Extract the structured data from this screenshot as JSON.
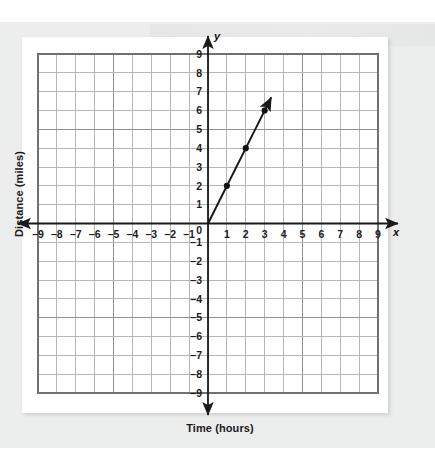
{
  "figure": {
    "x_axis_title": "Time (hours)",
    "y_axis_title": "Distance (miles)",
    "x_axis_letter": "x",
    "y_axis_letter": "y",
    "origin_label": "0"
  },
  "colors": {
    "page_background": "#ffffff",
    "panel_background": "#eceded",
    "plot_background": "#ffffff",
    "gridline": "#b4b7ba",
    "gridline_major": "#8d9093",
    "axis": "#1a1a1a",
    "line": "#151515",
    "point": "#121212",
    "text": "#1b1b1b"
  },
  "chart_data": {
    "type": "line",
    "title": "",
    "subtitle": "",
    "xlabel": "Time (hours)",
    "ylabel": "Distance (miles)",
    "xlim": [
      -9,
      9
    ],
    "ylim": [
      -9,
      9
    ],
    "grid": true,
    "legend": "none",
    "x_ticks": [
      -9,
      -8,
      -7,
      -6,
      -5,
      -4,
      -3,
      -2,
      -1,
      0,
      1,
      2,
      3,
      4,
      5,
      6,
      7,
      8,
      9
    ],
    "y_ticks": [
      -9,
      -8,
      -7,
      -6,
      -5,
      -4,
      -3,
      -2,
      -1,
      0,
      1,
      2,
      3,
      4,
      5,
      6,
      7,
      8,
      9
    ],
    "x_tick_labels": [
      "–9",
      "–8",
      "–7",
      "–6",
      "–5",
      "–4",
      "–3",
      "–2",
      "–1",
      "0",
      "1",
      "2",
      "3",
      "4",
      "5",
      "6",
      "7",
      "8",
      "9"
    ],
    "y_tick_labels": [
      "–9",
      "–8",
      "–7",
      "–6",
      "–5",
      "–4",
      "–3",
      "–2",
      "–1",
      "0",
      "1",
      "2",
      "3",
      "4",
      "5",
      "6",
      "7",
      "8",
      "9"
    ],
    "series": [
      {
        "name": "distance vs time",
        "slope": 2,
        "intercept": 0,
        "equation": "y = 2x",
        "x": [
          0,
          1,
          2,
          3
        ],
        "values": [
          0,
          2,
          4,
          6
        ],
        "marked_points": [
          {
            "x": 1,
            "y": 2
          },
          {
            "x": 2,
            "y": 4
          },
          {
            "x": 3,
            "y": 6
          }
        ],
        "line_start": {
          "x": 0,
          "y": 0
        },
        "line_end": {
          "x": 3.35,
          "y": 6.7
        },
        "arrow_at_end": true
      }
    ]
  }
}
